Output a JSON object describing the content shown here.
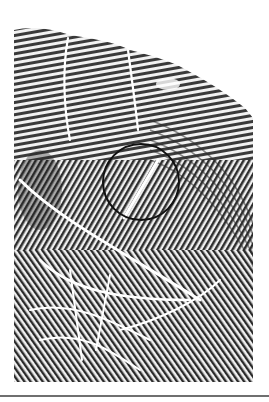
{
  "image": {
    "subject": "Fingerprint with ridge pattern and highlighted crease",
    "alt": "Fingerprint ridge pattern; a black circle highlights a white crease crossing the ridges",
    "colors": {
      "background": "#ffffff",
      "ridge": "#2a2a2a",
      "furrow": "#f2f2f2",
      "circle": "#111111",
      "rule": "#6f6f6f"
    },
    "annotation": {
      "shape": "circle",
      "center": [
        141,
        182
      ],
      "radius": 38
    }
  }
}
